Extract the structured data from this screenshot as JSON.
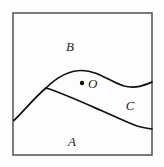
{
  "figure": {
    "title": "",
    "frame": {
      "x": 13,
      "y": 13,
      "width": 139,
      "height": 142,
      "stroke_color": "#5a5a5a",
      "stroke_width": 1.6,
      "fill_color": "#fdfdfd"
    },
    "curve_color": "#101010",
    "curve_width": 1.7,
    "regions": [
      {
        "key": "B",
        "label": "B",
        "x": 70,
        "y": 46
      },
      {
        "key": "C",
        "label": "C",
        "x": 130,
        "y": 105
      },
      {
        "key": "A",
        "label": "A",
        "x": 72,
        "y": 141
      }
    ],
    "points": [
      {
        "key": "O",
        "label": "O",
        "dot_x": 82,
        "dot_y": 83,
        "dot_radius": 2.2,
        "dot_color": "#101010",
        "label_x": 88,
        "label_y": 83
      }
    ],
    "curves": [
      {
        "key": "upper-boundary",
        "name": "boundary-B-C",
        "path": "M 46 88 C 56 78, 68 70.5, 82 70.5 C 98 70.5, 110 82, 124 86 C 136 89, 145 85, 152 82"
      },
      {
        "key": "lower-boundary",
        "name": "boundary-A-C",
        "path": "M 46 88 C 62 93, 82 102, 100 110 C 116 117, 128 123, 137 126 C 144 128, 148 128.5, 152 129"
      },
      {
        "key": "left-boundary",
        "name": "boundary-A-B",
        "path": "M 13.8 120.5 C 22 113, 34 98, 46 88"
      }
    ]
  }
}
